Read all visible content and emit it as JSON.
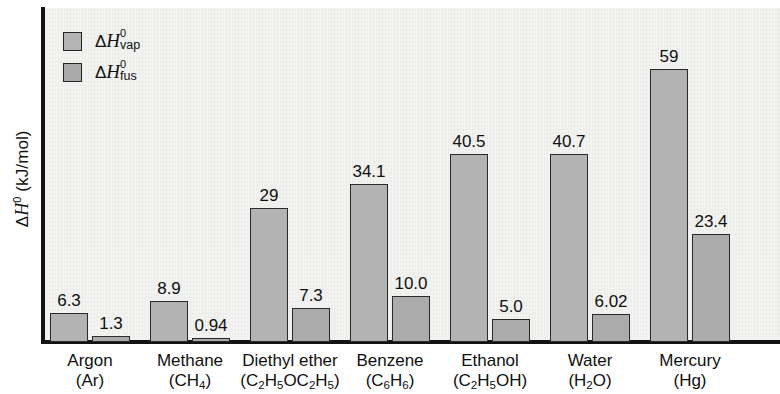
{
  "chart_data": {
    "type": "bar",
    "title": "",
    "xlabel": "",
    "ylabel": "ΔH0 (kJ/mol)",
    "ylim": [
      0,
      62
    ],
    "grid": false,
    "legend_position": "top-left",
    "categories": [
      "Argon (Ar)",
      "Methane (CH4)",
      "Diethyl ether (C2H5OC2H5)",
      "Benzene (C6H6)",
      "Ethanol (C2H5OH)",
      "Water (H2O)",
      "Mercury (Hg)"
    ],
    "series": [
      {
        "name": "ΔH0vap",
        "values": [
          6.3,
          8.9,
          29,
          34.1,
          40.5,
          40.7,
          59
        ],
        "labels": [
          "6.3",
          "8.9",
          "29",
          "34.1",
          "40.5",
          "40.7",
          "59"
        ],
        "color": "#b3b3b3"
      },
      {
        "name": "ΔH0fus",
        "values": [
          1.3,
          0.94,
          7.3,
          10.0,
          5.0,
          6.02,
          23.4
        ],
        "labels": [
          "1.3",
          "0.94",
          "7.3",
          "10.0",
          "5.0",
          "6.02",
          "23.4"
        ],
        "color": "#ababab"
      }
    ]
  },
  "axis": {
    "y_title_prefix": "Δ",
    "y_title_var": "H",
    "y_title_sup": "0",
    "y_title_unit": " (kJ/mol)"
  },
  "legend": {
    "items": [
      {
        "delta": "Δ",
        "var": "H",
        "sup": "0",
        "sub": "vap",
        "swatch_color": "#b5b5b5"
      },
      {
        "delta": "Δ",
        "var": "H",
        "sup": "0",
        "sub": "fus",
        "swatch_color": "#aaaaaa"
      }
    ]
  },
  "x_axis_labels": [
    {
      "name": "Argon",
      "formula_parts": [
        {
          "t": "(Ar)",
          "sub": false
        }
      ]
    },
    {
      "name": "Methane",
      "formula_parts": [
        {
          "t": "(CH",
          "sub": false
        },
        {
          "t": "4",
          "sub": true
        },
        {
          "t": ")",
          "sub": false
        }
      ]
    },
    {
      "name": "Diethyl ether",
      "formula_parts": [
        {
          "t": "(C",
          "sub": false
        },
        {
          "t": "2",
          "sub": true
        },
        {
          "t": "H",
          "sub": false
        },
        {
          "t": "5",
          "sub": true
        },
        {
          "t": "OC",
          "sub": false
        },
        {
          "t": "2",
          "sub": true
        },
        {
          "t": "H",
          "sub": false
        },
        {
          "t": "5",
          "sub": true
        },
        {
          "t": ")",
          "sub": false
        }
      ]
    },
    {
      "name": "Benzene",
      "formula_parts": [
        {
          "t": "(C",
          "sub": false
        },
        {
          "t": "6",
          "sub": true
        },
        {
          "t": "H",
          "sub": false
        },
        {
          "t": "6",
          "sub": true
        },
        {
          "t": ")",
          "sub": false
        }
      ]
    },
    {
      "name": "Ethanol",
      "formula_parts": [
        {
          "t": "(C",
          "sub": false
        },
        {
          "t": "2",
          "sub": true
        },
        {
          "t": "H",
          "sub": false
        },
        {
          "t": "5",
          "sub": true
        },
        {
          "t": "OH)",
          "sub": false
        }
      ]
    },
    {
      "name": "Water",
      "formula_parts": [
        {
          "t": "(H",
          "sub": false
        },
        {
          "t": "2",
          "sub": true
        },
        {
          "t": "O)",
          "sub": false
        }
      ]
    },
    {
      "name": "Mercury",
      "formula_parts": [
        {
          "t": "(Hg)",
          "sub": false
        }
      ]
    }
  ],
  "colors": {
    "background": "#f3f3f1",
    "axis": "#131313",
    "bar_vap": "#b3b3b3",
    "bar_fus": "#ababab",
    "bar_border": "#2a2a2a",
    "text": "#101010"
  }
}
